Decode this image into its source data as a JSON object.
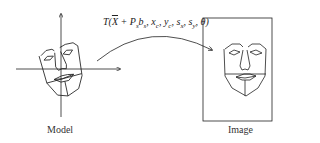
{
  "diagram": {
    "transform_label": "T(X̄ + Pₛbₛ, xᶜ, yᶜ, sₓ, sᵧ, θ)",
    "transform_parts": {
      "prefix": "T(",
      "xbar": "X",
      "mid": " + P",
      "s1": "s",
      "b": "b",
      "s2": "s",
      "rest1": ", x",
      "c1": "c",
      "rest2": ", y",
      "c2": "c",
      "rest3": ", s",
      "x": "x",
      "rest4": ", s",
      "y": "y",
      "rest5": ", θ)"
    },
    "left_caption": "Model",
    "right_caption": "Image",
    "colors": {
      "stroke": "#222222",
      "text": "#333333",
      "background": "#ffffff"
    }
  }
}
